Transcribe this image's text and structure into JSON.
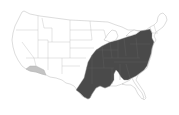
{
  "map": {
    "type": "choropleth",
    "region": "United States",
    "colors": {
      "background": "#ffffff",
      "default_fill": "#ffffff",
      "border": "#a8a8a8",
      "highlight_dark": "#4a4a4a",
      "highlight_light": "#c4c4c4"
    },
    "highlighted_regions": {
      "dark": [
        "Texas (east)",
        "Oklahoma (east)",
        "Kansas (east)",
        "Missouri",
        "Arkansas",
        "Louisiana (north)",
        "Mississippi (north)",
        "Alabama",
        "Georgia",
        "South Carolina",
        "North Carolina",
        "Tennessee",
        "Kentucky",
        "Illinois (south)",
        "Indiana",
        "Ohio",
        "West Virginia",
        "Virginia",
        "Maryland",
        "Delaware",
        "Pennsylvania",
        "New Jersey",
        "New York (west/central)",
        "Michigan (south)"
      ],
      "light": [
        "Southern Arizona",
        "Southeastern California"
      ]
    }
  }
}
